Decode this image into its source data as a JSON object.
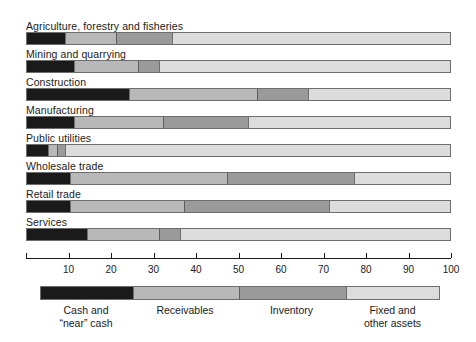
{
  "chart_data": {
    "type": "bar",
    "orientation": "horizontal",
    "stacked": true,
    "normalized_percent": true,
    "title": "",
    "subtitle": "",
    "xlabel": "",
    "ylabel": "",
    "xlim": [
      0,
      100
    ],
    "grid": false,
    "legend_position": "bottom",
    "categories": [
      "Agriculture, forestry and fisheries",
      "Mining and quarrying",
      "Construction",
      "Manufacturing",
      "Public utilities",
      "Wholesale trade",
      "Retail trade",
      "Services"
    ],
    "series": [
      {
        "name": "Cash and “near” cash",
        "color": "#1a1a1a",
        "values": [
          9,
          11,
          24,
          11,
          5,
          10,
          10,
          14
        ]
      },
      {
        "name": "Receivables",
        "color": "#b8b8b8",
        "values": [
          12,
          15,
          30,
          21,
          2,
          37,
          27,
          17
        ]
      },
      {
        "name": "Inventory",
        "color": "#9a9a9a",
        "values": [
          13,
          5,
          12,
          20,
          2,
          30,
          34,
          5
        ]
      },
      {
        "name": "Fixed and other assets",
        "color": "#dcdcdc",
        "values": [
          66,
          69,
          34,
          48,
          91,
          23,
          29,
          64
        ]
      }
    ],
    "cumulative_boundaries": [
      [
        9,
        21,
        34
      ],
      [
        11,
        26,
        31
      ],
      [
        24,
        54,
        66
      ],
      [
        11,
        32,
        52
      ],
      [
        5,
        7,
        9
      ],
      [
        10,
        47,
        77
      ],
      [
        10,
        37,
        71
      ],
      [
        14,
        31,
        36
      ]
    ],
    "xticks": [
      0,
      10,
      20,
      30,
      40,
      50,
      60,
      70,
      80,
      90,
      100
    ],
    "xtick_labels": [
      "",
      "10",
      "20",
      "30",
      "40",
      "50",
      "60",
      "70",
      "80",
      "90",
      "100"
    ],
    "legend": {
      "segments": [
        {
          "label_line1": "Cash and",
          "label_line2": "“near” cash",
          "start": 0,
          "end": 23,
          "color": "#1a1a1a"
        },
        {
          "label_line1": "Receivables",
          "label_line2": "",
          "start": 23,
          "end": 49.5,
          "color": "#b8b8b8"
        },
        {
          "label_line1": "Inventory",
          "label_line2": "",
          "start": 49.5,
          "end": 76.25,
          "color": "#9a9a9a"
        },
        {
          "label_line1": "Fixed and",
          "label_line2": "other assets",
          "start": 76.25,
          "end": 100,
          "color": "#dcdcdc"
        }
      ]
    }
  },
  "colors": {
    "cash": "#1a1a1a",
    "receivables": "#b8b8b8",
    "inventory": "#9a9a9a",
    "fixed": "#dcdcdc",
    "axis": "#1a1a1a",
    "bar_border": "#6e6e6e",
    "background": "#ffffff"
  }
}
